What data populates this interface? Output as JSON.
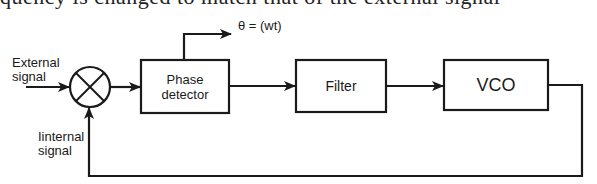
{
  "header": {
    "cut_off_text": "quency is changed to match that of the external signal"
  },
  "diagram": {
    "stroke_color": "#1a1a1a",
    "background": "#ffffff",
    "nodes": [
      {
        "id": "mixer",
        "type": "summing-junction",
        "symbol": "⊗"
      },
      {
        "id": "phase_detector",
        "label": "Phase detector",
        "label_line1": "Phase",
        "label_line2": "detector"
      },
      {
        "id": "filter",
        "label": "Filter"
      },
      {
        "id": "vco",
        "label": "VCO"
      }
    ],
    "labels": {
      "external_line1": "External",
      "external_line2": "signal",
      "internal_line1": "Iinternal",
      "internal_line2": "signal",
      "output": "θ = (wt)"
    },
    "edges": [
      {
        "from": "External signal",
        "to": "mixer"
      },
      {
        "from": "mixer",
        "to": "phase_detector"
      },
      {
        "from": "phase_detector",
        "to": "filter"
      },
      {
        "from": "phase_detector",
        "to": "θ = (wt)"
      },
      {
        "from": "filter",
        "to": "vco"
      },
      {
        "from": "vco",
        "to": "mixer",
        "label": "Iinternal signal",
        "kind": "feedback"
      }
    ]
  }
}
